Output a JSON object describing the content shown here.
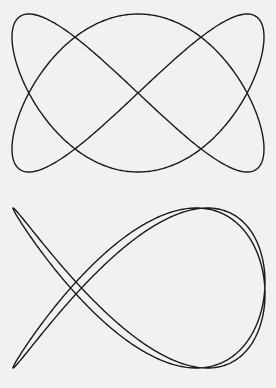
{
  "figures": [
    {
      "id": "top",
      "description": "Lissajous figure, frequency ratio x:y = 2:3",
      "x_freq": 2,
      "y_freq": 3,
      "x_phase": 0,
      "y_phase": 0,
      "x_fn": "sin",
      "y_fn": "sin",
      "center": [
        138,
        93
      ],
      "amplitude": [
        126,
        79
      ]
    },
    {
      "id": "bottom",
      "description": "Lissajous figure, frequency ratio x:y = 2:3, phase-shifted",
      "x_freq": 2,
      "y_freq": 3,
      "x_phase": 0.05,
      "y_phase": 0,
      "x_fn": "cos",
      "y_fn": "sin",
      "center": [
        139,
        94
      ],
      "amplitude": [
        126,
        80
      ]
    }
  ],
  "colors": {
    "background": "#f1f1ef",
    "stroke": "#1a1a1a"
  }
}
